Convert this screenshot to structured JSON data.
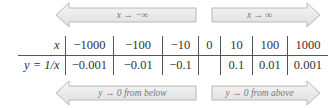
{
  "arrows": {
    "top_left": {
      "label": "x → −∞",
      "direction": "left"
    },
    "top_right": {
      "label": "x → ∞",
      "direction": "right"
    },
    "bottom_left": {
      "label": "y → 0 from below",
      "direction": "left"
    },
    "bottom_right": {
      "label": "y → 0 from above",
      "direction": "right"
    }
  },
  "table": {
    "row_labels": [
      "x",
      "y = 1/x"
    ],
    "x_values": [
      "−1000",
      "−100",
      "−10",
      "0",
      "10",
      "100",
      "1000"
    ],
    "y_values": [
      "−0.001",
      "−0.01",
      "−0.1",
      "",
      "0.1",
      "0.01",
      "0.001"
    ]
  },
  "colors": {
    "arrow_fill": "#ececec",
    "arrow_stroke": "#b8b8b8",
    "text": "#333333",
    "arrow_text": "#777777"
  }
}
